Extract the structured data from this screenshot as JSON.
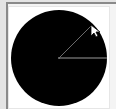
{
  "widget": {
    "type": "color-wheel-picker",
    "wheel_color": "#000000",
    "indicator_color": "#9a9a9a",
    "frame_border_color": "#8a8a8a",
    "background_color": "#e4e4e4",
    "panel_color": "#ffffff",
    "center": [
      59,
      58
    ],
    "radius": 48,
    "reference_angle_deg": 0,
    "selected_angle_deg": 45
  },
  "cursor": {
    "icon": "arrow-cursor-icon",
    "position": [
      91,
      27
    ]
  }
}
